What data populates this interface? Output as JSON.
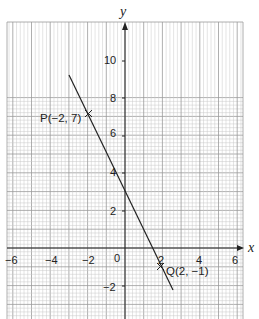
{
  "chart_data": {
    "type": "line",
    "title": "",
    "xlabel": "x",
    "ylabel": "y",
    "xlim": [
      -6.5,
      6.3
    ],
    "ylim": [
      -3.4,
      11.7
    ],
    "grid": true,
    "x_ticks": [
      -6,
      -4,
      -2,
      0,
      2,
      4,
      6
    ],
    "y_ticks": [
      -2,
      2,
      4,
      6,
      8,
      10
    ],
    "x_tick_labels": [
      "-6",
      "-4",
      "-2",
      "0",
      "2",
      "4",
      "6"
    ],
    "y_tick_labels": [
      "-2",
      "2",
      "4",
      "6",
      "8",
      "10"
    ],
    "origin_label": "0",
    "series": [
      {
        "name": "line PQ",
        "equation": "y = -2x + 3",
        "x": [
          -2.9,
          2.6
        ],
        "y": [
          8.8,
          -2.2
        ]
      }
    ],
    "points": [
      {
        "label": "P(−2, 7)",
        "x": -2,
        "y": 7,
        "marker": "x"
      },
      {
        "label": "Q(2, −1)",
        "x": 2,
        "y": -1,
        "marker": "x"
      }
    ]
  },
  "labels": {
    "x_axis": "x",
    "y_axis": "y",
    "origin": "0",
    "p": "P(−2, 7)",
    "q": "Q(2, −1)",
    "xt_m6": "−6",
    "xt_m4": "−4",
    "xt_m2": "−2",
    "xt_2": "2",
    "xt_4": "4",
    "xt_6": "6",
    "yt_m2": "−2",
    "yt_2": "2",
    "yt_4": "4",
    "yt_6": "6",
    "yt_8": "8",
    "yt_10": "10"
  }
}
